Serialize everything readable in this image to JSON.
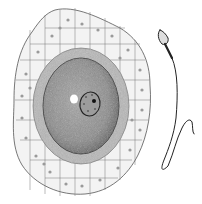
{
  "illustration": {
    "subject": "ovum-and-sperm",
    "colors": {
      "background": "#ffffff",
      "ink": "#222222",
      "cytoplasm": "#8a8a8a",
      "zona": "#b5b5b5",
      "cells": "#f2f2f2"
    }
  }
}
